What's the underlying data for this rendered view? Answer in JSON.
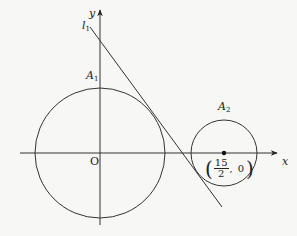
{
  "diagram": {
    "axes": {
      "x_label": "x",
      "y_label": "y",
      "origin_label": "O"
    },
    "line": {
      "label": "l",
      "label_sub": "1"
    },
    "circle1": {
      "label": "A",
      "label_sub": "1"
    },
    "circle2": {
      "label": "A",
      "label_sub": "2"
    },
    "point": {
      "num": "15",
      "den": "2",
      "y": "0",
      "open": "(",
      "close": ")",
      "comma": ","
    }
  }
}
